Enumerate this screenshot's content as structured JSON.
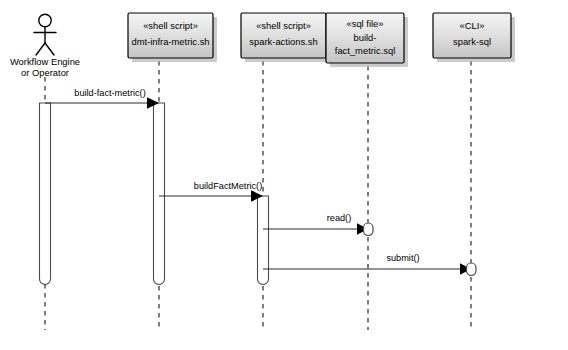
{
  "diagram": {
    "type": "uml-sequence-diagram",
    "background_color": "#ffffff",
    "box_fill_top": "#f2f2f2",
    "box_fill_bottom": "#c9c9c9",
    "line_color": "#000000",
    "width": 568,
    "height": 350
  },
  "participants": [
    {
      "id": "actor",
      "kind": "actor",
      "stereotype": "",
      "name_line1": "Workflow Engine",
      "name_line2": "or Operator",
      "lifeline_x": 45
    },
    {
      "id": "dmt-infra-metric",
      "kind": "box",
      "stereotype": "«shell script»",
      "name_line1": "dmt-infra-metric.sh",
      "name_line2": "",
      "lifeline_x": 159
    },
    {
      "id": "spark-actions",
      "kind": "box",
      "stereotype": "«shell script»",
      "name_line1": "spark-actions.sh",
      "name_line2": "",
      "lifeline_x": 263
    },
    {
      "id": "build-fact-metric-sql",
      "kind": "box",
      "stereotype": "«sql file»",
      "name_line1": "build-",
      "name_line2": "fact_metric.sql",
      "lifeline_x": 368
    },
    {
      "id": "spark-sql",
      "kind": "box",
      "stereotype": "«CLI»",
      "name_line1": "spark-sql",
      "name_line2": "",
      "lifeline_x": 471
    }
  ],
  "messages": [
    {
      "id": "msg-build-fact-metric",
      "label": "build-fact-metric()",
      "from": "actor",
      "to": "dmt-infra-metric",
      "y": 103,
      "label_x": 110,
      "label_y": 96,
      "endpoint": "activation"
    },
    {
      "id": "msg-build-fact-metric-camel",
      "label": "buildFactMetric()",
      "from": "dmt-infra-metric",
      "to": "spark-actions",
      "y": 196,
      "label_x": 228,
      "label_y": 189,
      "endpoint": "activation"
    },
    {
      "id": "msg-read",
      "label": "read()",
      "from": "spark-actions",
      "to": "build-fact-metric-sql",
      "y": 229,
      "label_x": 339,
      "label_y": 221,
      "endpoint": "circle"
    },
    {
      "id": "msg-submit",
      "label": "submit()",
      "from": "spark-actions",
      "to": "spark-sql",
      "y": 269,
      "label_x": 403,
      "label_y": 261,
      "endpoint": "circle"
    }
  ],
  "activations": [
    {
      "id": "activation-actor",
      "participant": "actor",
      "top": 103,
      "bottom": 284
    },
    {
      "id": "activation-dmt-infra-metric",
      "participant": "dmt-infra-metric",
      "top": 103,
      "bottom": 284
    },
    {
      "id": "activation-spark-actions",
      "participant": "spark-actions",
      "top": 196,
      "bottom": 284
    }
  ]
}
